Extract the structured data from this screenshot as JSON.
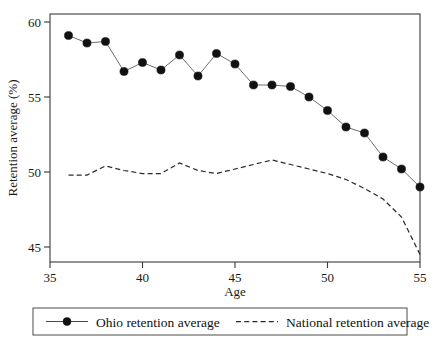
{
  "chart_data": {
    "type": "line",
    "title": "",
    "subtitle": "",
    "xlabel": "Age",
    "ylabel": "Retention average (%)",
    "xlim": [
      35,
      55
    ],
    "ylim": [
      44.2,
      60.3
    ],
    "xticks": [
      35,
      40,
      45,
      50,
      55
    ],
    "yticks": [
      45,
      50,
      55,
      60
    ],
    "xticklabels": [
      "35",
      "40",
      "45",
      "50",
      "55"
    ],
    "yticklabels": [
      "45",
      "50",
      "55",
      "60"
    ],
    "grid": false,
    "legend_position": "below-axes",
    "x": [
      36,
      37,
      38,
      39,
      40,
      41,
      42,
      43,
      44,
      45,
      46,
      47,
      48,
      49,
      50,
      51,
      52,
      53,
      54,
      55
    ],
    "series": [
      {
        "name": "Ohio retention average",
        "style": "solid-with-markers",
        "marker": "filled-circle",
        "color": "#111111",
        "values": [
          59.1,
          58.6,
          58.7,
          56.7,
          57.3,
          56.8,
          57.8,
          56.4,
          57.9,
          57.2,
          55.8,
          55.8,
          55.7,
          55.0,
          54.1,
          53.0,
          52.6,
          51.0,
          50.2,
          49.0
        ]
      },
      {
        "name": "National retention average",
        "style": "dashed",
        "marker": "none",
        "color": "#2b2b2b",
        "values": [
          49.8,
          49.8,
          50.4,
          50.1,
          49.9,
          49.9,
          50.6,
          50.1,
          49.9,
          50.2,
          50.5,
          50.8,
          50.5,
          50.2,
          49.9,
          49.5,
          48.9,
          48.2,
          47.0,
          44.5
        ]
      }
    ],
    "legend": [
      {
        "label": "Ohio retention average",
        "style": "solid-with-marker"
      },
      {
        "label": "National retention average",
        "style": "dashed"
      }
    ]
  },
  "axes": {
    "x_title": "Age",
    "y_title": "Retention average (%)"
  }
}
